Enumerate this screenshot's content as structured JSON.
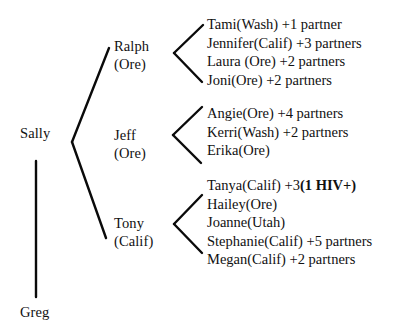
{
  "diagram": {
    "type": "family-partner-tree",
    "root": {
      "name": "Sally",
      "descendant_line_to": "Greg"
    },
    "children": [
      {
        "name": "Ralph",
        "location": "(Ore)",
        "partners": [
          {
            "text": "Tami(Wash) +1 partner",
            "bold_suffix": ""
          },
          {
            "text": "Jennifer(Calif) +3 partners",
            "bold_suffix": ""
          },
          {
            "text": "Laura (Ore) +2 partners",
            "bold_suffix": ""
          },
          {
            "text": "Joni(Ore) +2 partners",
            "bold_suffix": ""
          }
        ]
      },
      {
        "name": "Jeff",
        "location": "(Ore)",
        "partners": [
          {
            "text": "Angie(Ore) +4 partners",
            "bold_suffix": ""
          },
          {
            "text": "Kerri(Wash) +2 partners",
            "bold_suffix": ""
          },
          {
            "text": "Erika(Ore)",
            "bold_suffix": ""
          }
        ]
      },
      {
        "name": "Tony",
        "location": "(Calif)",
        "partners": [
          {
            "text": "Tanya(Calif) +3",
            "bold_suffix": "(1 HIV+)"
          },
          {
            "text": "Hailey(Ore)",
            "bold_suffix": ""
          },
          {
            "text": "Joanne(Utah)",
            "bold_suffix": ""
          },
          {
            "text": "Stephanie(Calif) +5 partners",
            "bold_suffix": ""
          },
          {
            "text": "Megan(Calif) +2 partners",
            "bold_suffix": ""
          }
        ]
      }
    ],
    "greg": {
      "name": "Greg"
    }
  },
  "colors": {
    "line": "#0a0a0a",
    "text": "#111111",
    "background": "#ffffff"
  }
}
